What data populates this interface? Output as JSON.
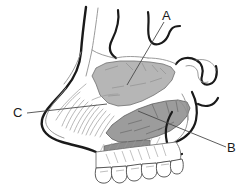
{
  "figure": {
    "labels": [
      {
        "id": "A",
        "text": "A"
      },
      {
        "id": "B",
        "text": "B"
      },
      {
        "id": "C",
        "text": "C"
      }
    ],
    "colors": {
      "background": "#ffffff",
      "outline_heavy": "#1a1a1a",
      "outline_light": "#8e8e8e",
      "shade_upper": "#b3b3b3",
      "shade_lower": "#9a9a9a",
      "shade_palate": "#8d8d8d",
      "label_text": "#1a1a1a",
      "leader_line": "#4a4a4a"
    }
  }
}
